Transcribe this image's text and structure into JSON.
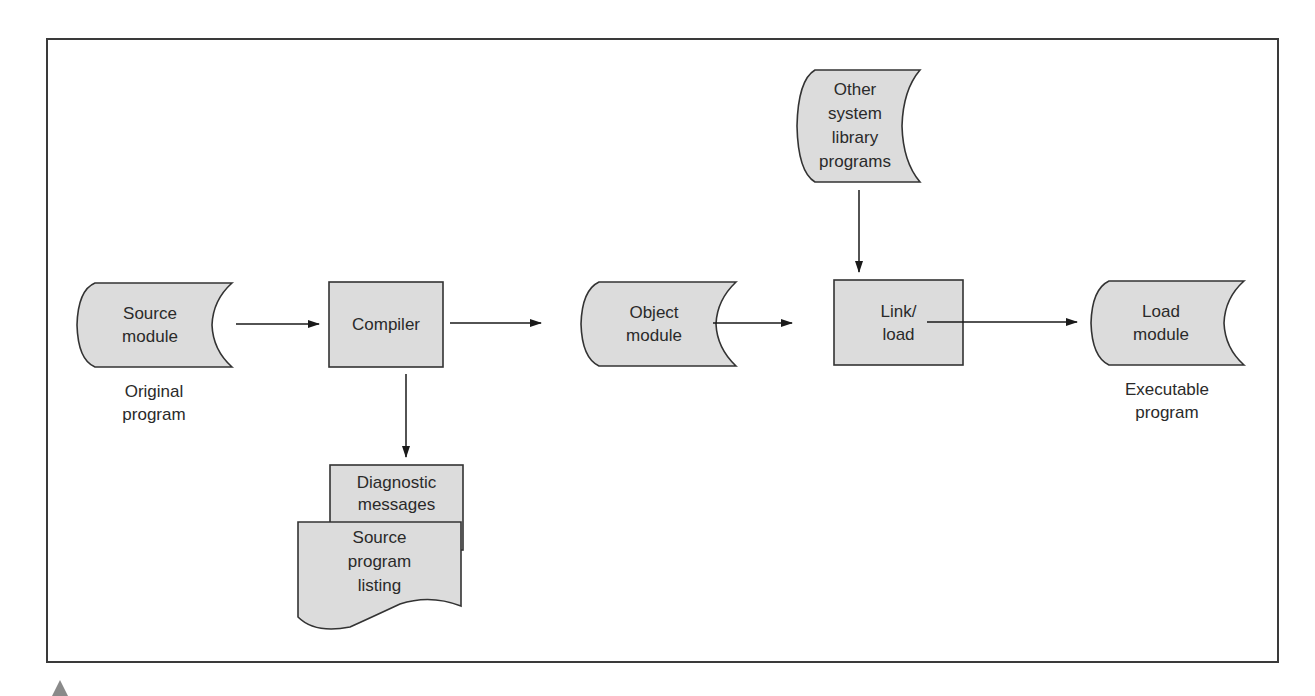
{
  "diagram": {
    "type": "flowchart",
    "colors": {
      "fill": "#dcdcdc",
      "stroke": "#333333",
      "text": "#2a2a2a",
      "frame": "#3a3a3a",
      "marker": "#8a8a8a"
    },
    "nodes": {
      "source_module": {
        "shape": "stored-data",
        "label": "Source\nmodule",
        "caption": "Original\nprogram"
      },
      "compiler": {
        "shape": "process",
        "label": "Compiler"
      },
      "object_module": {
        "shape": "stored-data",
        "label": "Object\nmodule"
      },
      "link_load": {
        "shape": "process",
        "label": "Link/\nload"
      },
      "load_module": {
        "shape": "stored-data",
        "label": "Load\nmodule",
        "caption": "Executable\nprogram"
      },
      "system_library": {
        "shape": "stored-data",
        "label": "Other\nsystem\nlibrary\nprograms"
      },
      "diagnostic_messages": {
        "shape": "rectangle",
        "label": "Diagnostic\nmessages"
      },
      "source_listing": {
        "shape": "document",
        "label": "Source\nprogram\nlisting"
      }
    },
    "edges": [
      {
        "from": "source_module",
        "to": "compiler"
      },
      {
        "from": "compiler",
        "to": "object_module"
      },
      {
        "from": "object_module",
        "to": "link_load"
      },
      {
        "from": "system_library",
        "to": "link_load"
      },
      {
        "from": "link_load",
        "to": "load_module"
      },
      {
        "from": "compiler",
        "to": "diagnostic_messages"
      }
    ]
  }
}
